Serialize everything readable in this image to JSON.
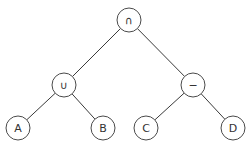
{
  "diagram": {
    "type": "expression-tree",
    "nodes": [
      {
        "id": "root",
        "label": "∩",
        "x": 129,
        "y": 20,
        "r": 12
      },
      {
        "id": "union",
        "label": "∪",
        "x": 64,
        "y": 85,
        "r": 12
      },
      {
        "id": "minus",
        "label": "−",
        "x": 193,
        "y": 85,
        "r": 12
      },
      {
        "id": "A",
        "label": "A",
        "x": 18,
        "y": 128,
        "r": 12
      },
      {
        "id": "B",
        "label": "B",
        "x": 103,
        "y": 128,
        "r": 12
      },
      {
        "id": "C",
        "label": "C",
        "x": 146,
        "y": 128,
        "r": 12
      },
      {
        "id": "D",
        "label": "D",
        "x": 233,
        "y": 128,
        "r": 12
      }
    ],
    "edges": [
      {
        "from": "root",
        "to": "union"
      },
      {
        "from": "root",
        "to": "minus"
      },
      {
        "from": "union",
        "to": "A"
      },
      {
        "from": "union",
        "to": "B"
      },
      {
        "from": "minus",
        "to": "C"
      },
      {
        "from": "minus",
        "to": "D"
      }
    ]
  }
}
